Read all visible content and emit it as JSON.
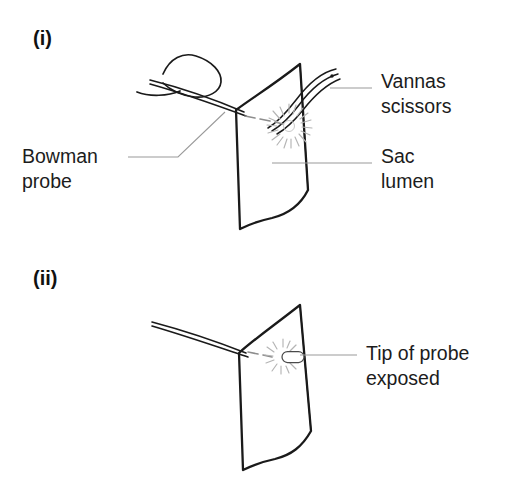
{
  "figure": {
    "background_color": "#ffffff",
    "ink_color": "#1a1a1a",
    "leader_color": "#9a9a9a",
    "burst_color": "#b4b4b4",
    "width": 521,
    "height": 492
  },
  "panels": [
    {
      "id": "panel-i",
      "index_label": "(i)",
      "index_x": 33,
      "index_y": 45,
      "callouts": [
        {
          "name": "bowman-probe",
          "lines": [
            "Bowman",
            "probe"
          ],
          "x": 22,
          "y": 163,
          "anchor": "start",
          "leader": "M 128 157 L 178 157 L 225 112"
        },
        {
          "name": "vannas-scissors",
          "lines": [
            "Vannas",
            "scissors"
          ],
          "x": 381,
          "y": 88,
          "anchor": "start",
          "leader": "M 330 88 L 372 88"
        },
        {
          "name": "sac-lumen",
          "lines": [
            "Sac",
            "lumen"
          ],
          "x": 381,
          "y": 163,
          "anchor": "start",
          "leader": "M 272 163 L 372 163"
        }
      ],
      "structures": {
        "sac_outline": "M 236 110 C 252 98 272 86 300 64 L 308 190 C 300 206 288 214 272 218 C 258 221 248 225 240 229 L 236 110 Z",
        "sac_fold": "M 300 64 L 308 190",
        "probe_shaft_upper": "M 150 80 C 182 88 216 100 244 112",
        "probe_shaft_lower": "M 150 84 C 182 93 216 105 246 116",
        "hand_outline": "M 163 74 C 170 58 183 52 196 56 C 212 61 222 72 221 82 C 220 92 208 98 195 97 C 182 96 170 90 163 83",
        "hand_thumb": "M 137 92 C 150 97 168 96 180 91",
        "scissor_blade_outer": "M 336 69 C 322 72 308 84 296 100 C 286 113 278 122 268 128",
        "scissor_blade_mid": "M 338 74 C 324 78 310 90 299 105 C 290 117 282 125 272 131",
        "scissor_blade_inner": "M 340 79 C 327 84 314 96 303 110 C 294 121 286 129 277 134",
        "scissor_pivot_dot": {
          "cx": 332,
          "cy": 76,
          "r": 1.7
        }
      },
      "incision": {
        "dashes": [
          "M 245 116 L 255 118",
          "M 260 119 L 270 121",
          "M 275 122 L 283 124"
        ],
        "burst_center": {
          "cx": 289,
          "cy": 126,
          "r": 9
        },
        "burst_rays": 20
      }
    },
    {
      "id": "panel-ii",
      "index_label": "(ii)",
      "index_x": 33,
      "index_y": 285,
      "callouts": [
        {
          "name": "tip-of-probe-exposed",
          "lines": [
            "Tip of probe",
            "exposed"
          ],
          "x": 366,
          "y": 360,
          "anchor": "start",
          "leader": "M 300 355 L 357 355"
        }
      ],
      "structures": {
        "sac_outline": "M 239 353 C 253 340 272 327 300 305 L 311 431 C 302 447 291 455 275 459 C 261 462 251 466 243 470 L 239 353 Z",
        "sac_fold": "M 300 305 L 311 431",
        "probe_shaft_upper": "M 152 322 C 186 331 218 342 246 353",
        "probe_shaft_lower": "M 152 326 C 186 336 218 347 248 357"
      },
      "incision": {
        "dashes": [
          "M 248 352 L 258 354",
          "M 263 355 L 272 357"
        ],
        "burst_center": {
          "cx": 283,
          "cy": 357,
          "r": 8
        },
        "burst_rays": 16,
        "tip_capsule": {
          "cx": 293,
          "cy": 357,
          "rx": 11,
          "ry": 5.5
        }
      }
    }
  ]
}
